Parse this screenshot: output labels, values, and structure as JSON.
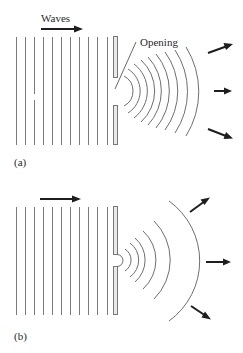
{
  "figure": {
    "panel_a": {
      "tag": "(a)",
      "wave_label": "Waves",
      "opening_label": "Opening",
      "plane_wave_count": 11,
      "arc_count": 9,
      "outgoing_arrows": 3
    },
    "panel_b": {
      "tag": "(b)",
      "plane_wave_count": 11,
      "arc_count": 6,
      "outgoing_arrows": 3
    },
    "colors": {
      "line": "#7a7a7a",
      "arrow": "#1e1e1e",
      "barrier_fill": "#e9e9e9",
      "background": "#ffffff"
    }
  }
}
